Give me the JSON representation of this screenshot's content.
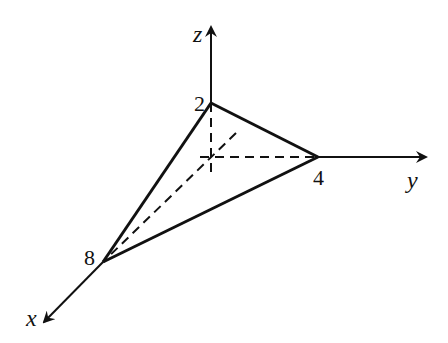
{
  "diagram": {
    "type": "3d-coordinate-tetrahedron",
    "axes": {
      "x": {
        "label": "x"
      },
      "y": {
        "label": "y"
      },
      "z": {
        "label": "z"
      }
    },
    "intercepts": {
      "x": "8",
      "y": "4",
      "z": "2"
    },
    "colors": {
      "ink": "#111111",
      "background": "#ffffff"
    }
  }
}
